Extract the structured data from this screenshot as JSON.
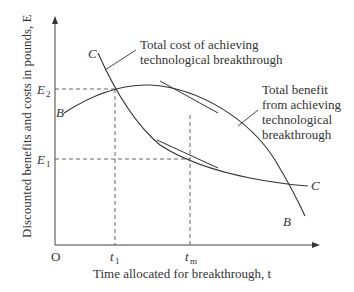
{
  "diagram": {
    "y_axis_label": "Discounted benefits and costs in pounds, E",
    "x_axis_label": "Time allocated for breakthrough, t",
    "origin_label": "O",
    "y_ticks": {
      "e2": "E",
      "e2_sub": "2",
      "e1": "E",
      "e1_sub": "1"
    },
    "x_ticks": {
      "t1": "t",
      "t1_sub": "1",
      "tm": "t",
      "tm_sub": "m"
    },
    "curves": {
      "cost": {
        "start_label": "C",
        "end_label": "C",
        "annotation_line1": "Total cost of achieving",
        "annotation_line2": "technological breakthrough"
      },
      "benefit": {
        "start_label": "B",
        "end_label": "B",
        "annotation_line1": "Total benefit",
        "annotation_line2": "from achieving",
        "annotation_line3": "technological",
        "annotation_line4": "breakthrough"
      }
    },
    "colors": {
      "line": "#333333",
      "dashed": "#555555"
    }
  }
}
